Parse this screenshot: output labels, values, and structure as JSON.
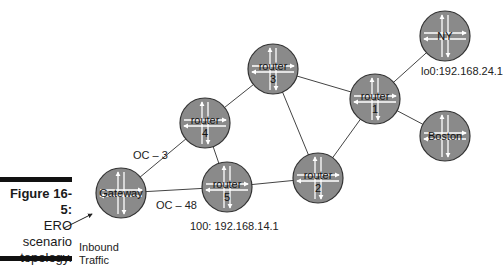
{
  "figure": {
    "number_label": "Figure 16-5:",
    "caption_lines": [
      "ERO",
      "scenario",
      "topology."
    ]
  },
  "annotations": {
    "inbound_line1": "Inbound",
    "inbound_line2": "Traffic",
    "router5_address": "100: 192.168.14.1",
    "ny_address": "lo0:192.168.24.1"
  },
  "nodes": [
    {
      "id": "gateway",
      "label": "Gateway",
      "sub": "",
      "cx": 121,
      "cy": 193
    },
    {
      "id": "router4",
      "label": "router",
      "sub": "4",
      "cx": 205,
      "cy": 123
    },
    {
      "id": "router5",
      "label": "router",
      "sub": "5",
      "cx": 227,
      "cy": 187
    },
    {
      "id": "router3",
      "label": "router",
      "sub": "3",
      "cx": 273,
      "cy": 69
    },
    {
      "id": "router2",
      "label": "router",
      "sub": "2",
      "cx": 318,
      "cy": 178
    },
    {
      "id": "router1",
      "label": "router",
      "sub": "1",
      "cx": 375,
      "cy": 99
    },
    {
      "id": "ny",
      "label": "NY",
      "sub": "",
      "cx": 445,
      "cy": 36
    },
    {
      "id": "boston",
      "label": "Boston",
      "sub": "",
      "cx": 445,
      "cy": 136
    }
  ],
  "links": [
    {
      "from": "gateway",
      "to": "router4",
      "label": "OC – 3"
    },
    {
      "from": "gateway",
      "to": "router5",
      "label": "OC – 48"
    },
    {
      "from": "router4",
      "to": "router5",
      "label": ""
    },
    {
      "from": "router4",
      "to": "router3",
      "label": ""
    },
    {
      "from": "router5",
      "to": "router2",
      "label": ""
    },
    {
      "from": "router3",
      "to": "router2",
      "label": ""
    },
    {
      "from": "router3",
      "to": "router1",
      "label": ""
    },
    {
      "from": "router2",
      "to": "router1",
      "label": ""
    },
    {
      "from": "router1",
      "to": "ny",
      "label": ""
    },
    {
      "from": "router1",
      "to": "boston",
      "label": ""
    }
  ],
  "link_labels": {
    "oc3": "OC – 3",
    "oc48": "OC – 48"
  },
  "colors": {
    "node_fill": "#8a8a8a",
    "node_stroke": "#333333",
    "arrow": "#ffffff",
    "link": "#444444"
  }
}
